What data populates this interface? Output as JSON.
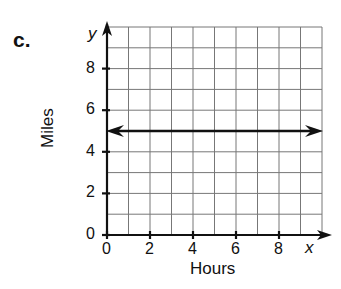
{
  "panel_label": "c.",
  "chart_data": {
    "type": "line",
    "title": "",
    "xlabel": "Hours",
    "ylabel": "Miles",
    "x_axis_letter": "x",
    "y_axis_letter": "y",
    "xlim": [
      0,
      10
    ],
    "ylim": [
      0,
      10
    ],
    "x_ticks": [
      "0",
      "2",
      "4",
      "6",
      "8"
    ],
    "y_ticks": [
      "0",
      "2",
      "4",
      "6",
      "8"
    ],
    "grid": true,
    "grid_step": 1,
    "series": [
      {
        "name": "line",
        "equation": "y = 5",
        "x": [
          0,
          10
        ],
        "y": [
          5,
          5
        ],
        "arrows_both_ends": true
      }
    ]
  }
}
